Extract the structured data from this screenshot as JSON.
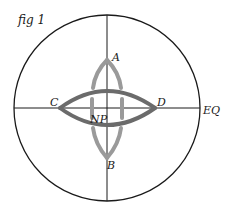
{
  "figure": {
    "caption": "fig 1",
    "labels": {
      "top": "A",
      "bottom": "B",
      "left": "C",
      "right": "D",
      "center": "NP",
      "equator": "EQ"
    }
  },
  "colors": {
    "background": "#ffffff",
    "outline": "#1a1a1a",
    "horizontal_lens": "#6b6b6b",
    "vertical_lens": "#9a9a9a"
  },
  "geometry": {
    "circle": {
      "cx": 107,
      "cy": 108,
      "r": 93
    },
    "horizontal_lens": {
      "x1": 60,
      "x2": 155,
      "bulge": 17
    },
    "vertical_lens": {
      "y1": 60,
      "y2": 158,
      "bulge": 14
    }
  }
}
